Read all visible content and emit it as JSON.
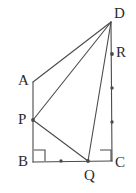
{
  "figure": {
    "name": "geometry-quadrilateral-diagram",
    "type": "plane-geometry-line-figure",
    "canvas": {
      "width": 136,
      "height": 193
    },
    "background_color": "#ffffff",
    "stroke_color": "#4a4a4a",
    "label_color": "#2b2b2b",
    "stroke_width": 1.1
  },
  "points": [
    {
      "id": "A",
      "label": "A",
      "x": 33,
      "y": 82,
      "label_x": 18,
      "label_y": 73,
      "marked_dot": false
    },
    {
      "id": "B",
      "label": "B",
      "x": 33,
      "y": 162,
      "label_x": 18,
      "label_y": 154,
      "marked_dot": false
    },
    {
      "id": "C",
      "label": "C",
      "x": 112,
      "y": 161,
      "label_x": 115,
      "label_y": 155,
      "marked_dot": false
    },
    {
      "id": "D",
      "label": "D",
      "x": 111,
      "y": 22,
      "label_x": 114,
      "label_y": 6,
      "marked_dot": false
    },
    {
      "id": "P",
      "label": "P",
      "x": 33,
      "y": 120,
      "label_x": 18,
      "label_y": 112,
      "marked_dot": true
    },
    {
      "id": "Q",
      "label": "Q",
      "x": 88,
      "y": 161,
      "label_x": 84,
      "label_y": 168,
      "marked_dot": true
    },
    {
      "id": "R",
      "label": "R",
      "x": 112,
      "y": 54,
      "label_x": 116,
      "label_y": 45,
      "marked_dot": true
    }
  ],
  "segments": [
    {
      "id": "AB",
      "from": "A",
      "to": "B",
      "name": "segment-ab"
    },
    {
      "id": "BC",
      "from": "B",
      "to": "C",
      "name": "segment-bc"
    },
    {
      "id": "DC",
      "from": "D",
      "to": "C",
      "name": "segment-dc"
    },
    {
      "id": "AD",
      "from": "A",
      "to": "D",
      "name": "segment-ad"
    },
    {
      "id": "PD",
      "from": "P",
      "to": "D",
      "name": "segment-pd"
    },
    {
      "id": "PQ",
      "from": "P",
      "to": "Q",
      "name": "segment-pq"
    },
    {
      "id": "QD",
      "from": "Q",
      "to": "D",
      "name": "segment-qd"
    }
  ],
  "right_angles": [
    {
      "id": "angle-B",
      "vertex": "B",
      "x": 34,
      "y": 150,
      "size": 11,
      "dir_x": 1,
      "dir_y": -1,
      "name": "right-angle-mark-b"
    },
    {
      "id": "angle-C",
      "vertex": "C",
      "x": 100,
      "y": 150,
      "size": 11,
      "dir_x": 1,
      "dir_y": -1,
      "name": "right-angle-mark-c"
    }
  ],
  "tick_dots": [
    {
      "id": "bq-midpoint",
      "x": 61,
      "y": 161,
      "name": "tick-dot-bq-midpoint"
    },
    {
      "id": "dc-tick-1",
      "x": 112,
      "y": 88,
      "name": "tick-dot-dc-upper"
    },
    {
      "id": "dc-tick-2",
      "x": 112,
      "y": 122,
      "name": "tick-dot-dc-lower"
    }
  ]
}
